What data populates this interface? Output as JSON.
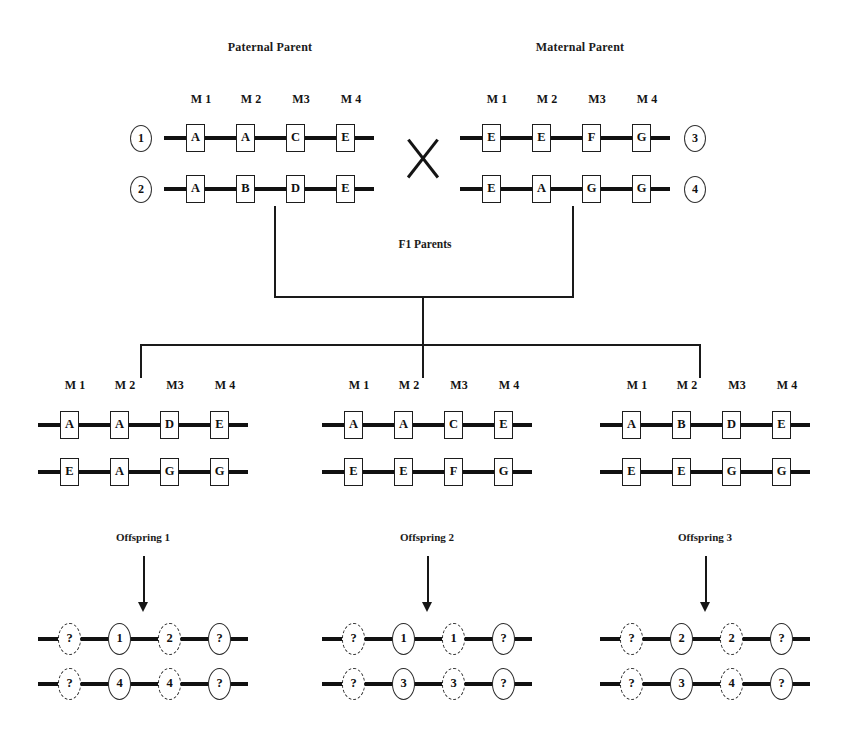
{
  "diagram": {
    "title_paternal": "Paternal Parent",
    "title_maternal": "Maternal Parent",
    "title_f1": "F1 Parents",
    "marker_labels": [
      "M 1",
      "M 2",
      "M3",
      "M 4"
    ]
  },
  "parents": {
    "paternal": {
      "label": "Paternal Parent",
      "chromosomes": [
        {
          "index": "1",
          "alleles": [
            "A",
            "A",
            "C",
            "E"
          ]
        },
        {
          "index": "2",
          "alleles": [
            "A",
            "B",
            "D",
            "E"
          ]
        }
      ]
    },
    "maternal": {
      "label": "Maternal Parent",
      "chromosomes": [
        {
          "index": "3",
          "alleles": [
            "E",
            "E",
            "F",
            "G"
          ]
        },
        {
          "index": "4",
          "alleles": [
            "E",
            "A",
            "G",
            "G"
          ]
        }
      ]
    }
  },
  "f1_parents": {
    "label": "F1 Parents",
    "groups": [
      {
        "name": "f1-group-1",
        "chromosomes": [
          {
            "alleles": [
              "A",
              "A",
              "D",
              "E"
            ]
          },
          {
            "alleles": [
              "E",
              "A",
              "G",
              "G"
            ]
          }
        ]
      },
      {
        "name": "f1-group-2",
        "chromosomes": [
          {
            "alleles": [
              "A",
              "A",
              "C",
              "E"
            ]
          },
          {
            "alleles": [
              "E",
              "E",
              "F",
              "G"
            ]
          }
        ]
      },
      {
        "name": "f1-group-3",
        "chromosomes": [
          {
            "alleles": [
              "A",
              "B",
              "D",
              "E"
            ]
          },
          {
            "alleles": [
              "E",
              "E",
              "G",
              "G"
            ]
          }
        ]
      }
    ]
  },
  "offspring": [
    {
      "label": "Offspring 1",
      "chromosomes": [
        {
          "alleles": [
            "?",
            "1",
            "2",
            "?"
          ],
          "dashed": [
            true,
            false,
            true,
            false
          ]
        },
        {
          "alleles": [
            "?",
            "4",
            "4",
            "?"
          ],
          "dashed": [
            true,
            false,
            true,
            false
          ]
        }
      ]
    },
    {
      "label": "Offspring 2",
      "chromosomes": [
        {
          "alleles": [
            "?",
            "1",
            "1",
            "?"
          ],
          "dashed": [
            true,
            false,
            true,
            false
          ]
        },
        {
          "alleles": [
            "?",
            "3",
            "3",
            "?"
          ],
          "dashed": [
            true,
            false,
            true,
            false
          ]
        }
      ]
    },
    {
      "label": "Offspring 3",
      "chromosomes": [
        {
          "alleles": [
            "?",
            "2",
            "2",
            "?"
          ],
          "dashed": [
            true,
            false,
            true,
            false
          ]
        },
        {
          "alleles": [
            "?",
            "3",
            "4",
            "?"
          ],
          "dashed": [
            true,
            false,
            true,
            false
          ]
        }
      ]
    }
  ],
  "colors": {
    "ink": "#111111",
    "background": "#ffffff"
  }
}
